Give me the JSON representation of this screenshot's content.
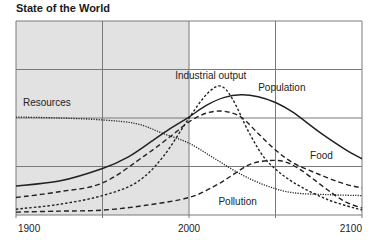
{
  "title": "State of the World",
  "colors": {
    "shade": "#e2e2e2",
    "grid": "#7a7a7a",
    "line": "#222222",
    "background": "#ffffff"
  },
  "chart_data": {
    "type": "line",
    "title": "State of the World",
    "xlabel": "",
    "ylabel": "",
    "xlim": [
      1900,
      2100
    ],
    "ylim": [
      0,
      100
    ],
    "x_ticks": [
      1900,
      2000,
      2100
    ],
    "x_tick_labels": [
      "1900",
      "2000",
      "2100"
    ],
    "grid": {
      "x": [
        1900,
        1950,
        2000,
        2050,
        2100
      ],
      "y": [
        0,
        25,
        50,
        75,
        100
      ]
    },
    "shaded_region": {
      "x_from": 1900,
      "x_to": 2000,
      "note": "historical period"
    },
    "legend_position": "inline labels",
    "series": [
      {
        "name": "Resources",
        "style": "dotted",
        "label_pos": [
          1904,
          56
        ],
        "x": [
          1900,
          1925,
          1950,
          1970,
          1985,
          2000,
          2015,
          2030,
          2045,
          2060,
          2080,
          2100
        ],
        "values": [
          50.5,
          50,
          49,
          47,
          42,
          37,
          29,
          21,
          15,
          11.5,
          10.5,
          10
        ]
      },
      {
        "name": "Population",
        "style": "solid",
        "label_pos": [
          2040,
          64
        ],
        "x": [
          1900,
          1925,
          1950,
          1965,
          1980,
          1990,
          2000,
          2010,
          2020,
          2030,
          2040,
          2050,
          2060,
          2075,
          2090,
          2100
        ],
        "values": [
          15,
          17.5,
          24,
          30,
          39,
          45,
          50.5,
          56.5,
          60.5,
          62,
          61,
          58,
          53,
          43,
          34,
          29
        ]
      },
      {
        "name": "Food",
        "style": "dashed",
        "label_pos": [
          2070,
          29
        ],
        "x": [
          1900,
          1925,
          1950,
          1975,
          1990,
          2000,
          2010,
          2020,
          2030,
          2040,
          2050,
          2060,
          2075,
          2090,
          2100
        ],
        "values": [
          9,
          12,
          16.5,
          31,
          41,
          48,
          52.5,
          53.5,
          50.5,
          42,
          33.5,
          27,
          21,
          16,
          14
        ]
      },
      {
        "name": "Industrial output",
        "style": "dotted-dashed",
        "label_pos": [
          1992,
          70
        ],
        "x": [
          1900,
          1925,
          1950,
          1970,
          1985,
          2000,
          2010,
          2018,
          2025,
          2035,
          2045,
          2060,
          2080,
          2100
        ],
        "values": [
          3,
          5.5,
          10,
          17,
          30,
          50,
          62,
          66.5,
          60,
          42,
          28,
          17,
          8,
          2.5
        ]
      },
      {
        "name": "Pollution",
        "style": "dashed",
        "label_pos": [
          2017,
          5
        ],
        "x": [
          1900,
          1925,
          1950,
          1975,
          2000,
          2015,
          2025,
          2035,
          2045,
          2055,
          2065,
          2080,
          2090,
          2100
        ],
        "values": [
          1.5,
          2,
          2.5,
          5,
          9,
          15,
          20.5,
          26,
          28,
          27.5,
          23,
          13,
          7,
          3.5
        ]
      }
    ]
  }
}
